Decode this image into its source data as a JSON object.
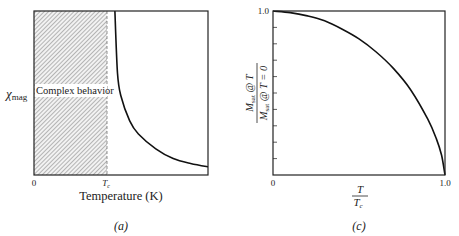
{
  "chart_data": [
    {
      "id": "a",
      "type": "line",
      "panel_label": "(a)",
      "title": "",
      "xlabel": "Temperature (K)",
      "ylabel": "χmag",
      "ylabel_main": "χ",
      "ylabel_sub": "mag",
      "x_ticks": [
        {
          "label": "0",
          "value": 0
        },
        {
          "label": "T",
          "sub": "c",
          "value": 0.43
        }
      ],
      "shaded_region": {
        "from": 0,
        "to": 0.43,
        "pattern": "diagonal-hatch",
        "label": "Complex behavior"
      },
      "series": [
        {
          "name": "susceptibility",
          "description": "χmag diverges as T approaches Tc from above and decays (Curie-Weiss-like) at higher T",
          "x": [
            0.465,
            0.48,
            0.5,
            0.55,
            0.6,
            0.7,
            0.8,
            0.9,
            1.0
          ],
          "y": [
            1.0,
            0.62,
            0.48,
            0.33,
            0.25,
            0.16,
            0.1,
            0.07,
            0.05
          ]
        }
      ],
      "xlim": [
        0,
        1
      ],
      "ylim": [
        0,
        1
      ],
      "grid": false,
      "legend": null
    },
    {
      "id": "c",
      "type": "line",
      "panel_label": "(c)",
      "title": "",
      "xlabel": "T / Tc",
      "xlabel_num": "T",
      "xlabel_den": "T",
      "xlabel_den_sub": "c",
      "ylabel": "Msat @ T / Msat @ T = 0",
      "ylabel_num": "M",
      "ylabel_num_sub": "sat",
      "ylabel_num_rest": " @ T",
      "ylabel_den": "M",
      "ylabel_den_sub": "sat",
      "ylabel_den_rest": " @ T = 0",
      "x_ticks": [
        {
          "label": "0",
          "value": 0
        },
        {
          "label": "1.0",
          "value": 1.0
        }
      ],
      "y_ticks": [
        {
          "label": "1.0",
          "value": 1.0
        }
      ],
      "y_minor_ticks": 10,
      "series": [
        {
          "name": "reduced saturation magnetization",
          "x": [
            0,
            0.1,
            0.2,
            0.3,
            0.4,
            0.5,
            0.6,
            0.7,
            0.8,
            0.9,
            0.95,
            0.98,
            1.0
          ],
          "y": [
            1.0,
            0.99,
            0.97,
            0.94,
            0.89,
            0.83,
            0.75,
            0.65,
            0.52,
            0.34,
            0.22,
            0.12,
            0.0
          ]
        }
      ],
      "xlim": [
        0,
        1
      ],
      "ylim": [
        0,
        1
      ],
      "grid": false,
      "legend": null
    }
  ]
}
